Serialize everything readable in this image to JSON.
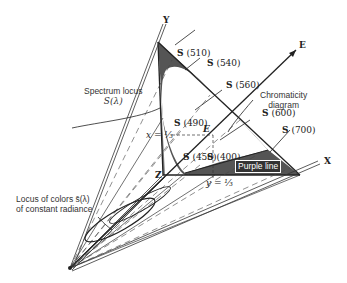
{
  "diagram": {
    "axes": {
      "x": "X",
      "y": "Y",
      "z": "Z",
      "e": "E"
    },
    "points": [
      {
        "label": "S",
        "wavelength": "(510)"
      },
      {
        "label": "S",
        "wavelength": "(540)"
      },
      {
        "label": "S",
        "wavelength": "(560)"
      },
      {
        "label": "S",
        "wavelength": "(490)"
      },
      {
        "label": "S",
        "wavelength": "(600)"
      },
      {
        "label": "S",
        "wavelength": "(700)"
      },
      {
        "label": "S",
        "wavelength": "(450)"
      },
      {
        "label": "S",
        "wavelength": "(400)"
      }
    ],
    "center_point": "E",
    "x_eq": "x = ⅓",
    "y_eq": "y = ⅓",
    "callouts": {
      "spectrum_locus_line1": "Spectrum locus",
      "spectrum_locus_line2": "S(λ)",
      "chromaticity_line1": "Chromaticity",
      "chromaticity_line2": "diagram",
      "purple_line": "Purple line",
      "locus_line1": "Locus of colors s̄(λ)",
      "locus_line2": "of constant radiance"
    },
    "colors": {
      "ink": "#222222",
      "fill": "#555555",
      "fill_light": "#8a8a8a"
    }
  }
}
